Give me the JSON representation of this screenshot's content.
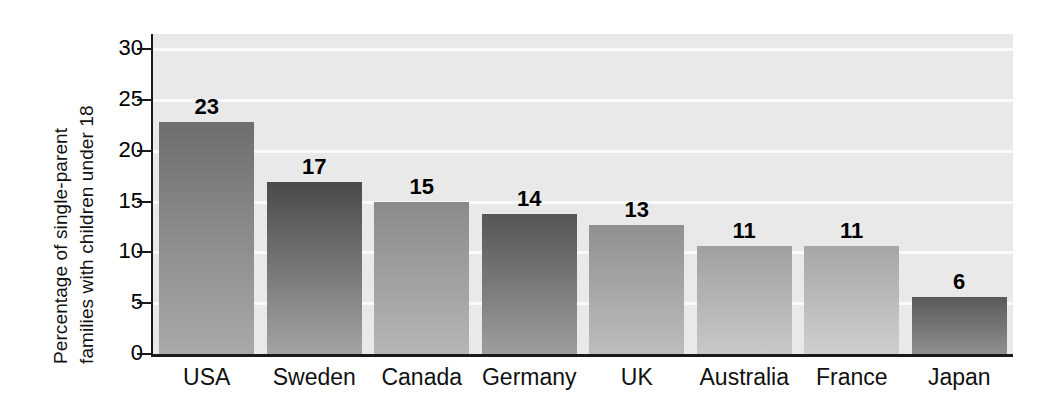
{
  "chart_data": {
    "type": "bar",
    "title": "",
    "subtitle": "",
    "xlabel": "",
    "ylabel": "Percentage of single-parent families with children under 18",
    "ylabel_lines": [
      "Percentage of single-parent",
      "families with children under 18"
    ],
    "categories": [
      "USA",
      "Sweden",
      "Canada",
      "Germany",
      "UK",
      "Australia",
      "France",
      "Japan"
    ],
    "values": [
      23,
      17,
      15,
      14,
      13,
      11,
      11,
      6
    ],
    "value_labels": [
      "23",
      "17",
      "15",
      "14",
      "13",
      "11",
      "11",
      "6"
    ],
    "bar_heights_plotted": [
      22.8,
      16.9,
      15.0,
      13.8,
      12.7,
      10.6,
      10.6,
      5.6
    ],
    "ylim": [
      0,
      31.5
    ],
    "yticks": [
      0,
      5,
      10,
      15,
      20,
      25,
      30
    ],
    "ytick_labels": [
      "0",
      "5",
      "10",
      "15",
      "20",
      "25",
      "30"
    ],
    "grid": true,
    "grid_axis": "y",
    "gridline_color": "#fafafa",
    "plot_background": "#e9e9e9",
    "figure_background": "#ffffff",
    "axis_color": "#1a1a1a",
    "legend": null,
    "legend_position": "none",
    "bar_gradients": [
      {
        "top": "#6e6e6e",
        "bottom": "#a9a9a9"
      },
      {
        "top": "#4a4a4a",
        "bottom": "#a3a3a3"
      },
      {
        "top": "#8a8a8a",
        "bottom": "#b6b6b6"
      },
      {
        "top": "#565656",
        "bottom": "#9d9d9d"
      },
      {
        "top": "#909090",
        "bottom": "#bdbdbd"
      },
      {
        "top": "#a0a0a0",
        "bottom": "#c8c8c8"
      },
      {
        "top": "#a6a6a6",
        "bottom": "#cfcfcf"
      },
      {
        "top": "#5a5a5a",
        "bottom": "#8f8f8f"
      }
    ]
  }
}
